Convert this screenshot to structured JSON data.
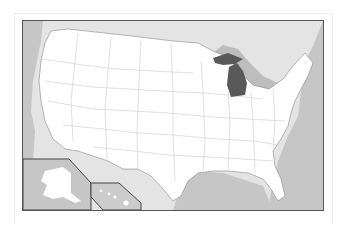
{
  "map": {
    "title": "United States locator map",
    "highlighted_state": "Michigan",
    "colors": {
      "ocean": "#c8c8c8",
      "foreign_land": "#e2e2e2",
      "states": "#ffffff",
      "state_borders": "#cfcfcf",
      "highlight": "#5a5a5a",
      "great_lakes": "#b8b8b8",
      "frame": "#555555"
    },
    "insets": [
      "Alaska",
      "Hawaii"
    ]
  }
}
